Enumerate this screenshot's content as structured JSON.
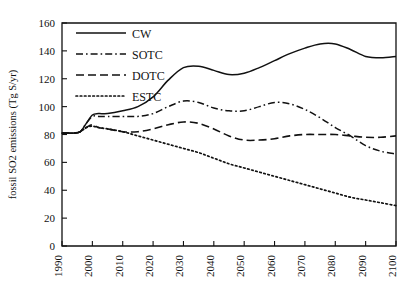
{
  "chart_data": {
    "type": "line",
    "title": "",
    "subtitle": "",
    "xlabel": "",
    "ylabel": "fossil SO2 emissions (Tg S/yr)",
    "xlim": [
      1990,
      2100
    ],
    "ylim": [
      0,
      160
    ],
    "grid": false,
    "legend_position": "top-left",
    "x_ticks": [
      "1990",
      "2000",
      "2010",
      "2020",
      "2030",
      "2040",
      "2050",
      "2060",
      "2070",
      "2080",
      "2090",
      "2100"
    ],
    "x_tick_values": [
      1990,
      2000,
      2010,
      2020,
      2030,
      2040,
      2050,
      2060,
      2070,
      2080,
      2090,
      2100
    ],
    "y_ticks": [
      "0",
      "20",
      "40",
      "60",
      "80",
      "100",
      "120",
      "140",
      "160"
    ],
    "y_tick_values": [
      0,
      20,
      40,
      60,
      80,
      100,
      120,
      140,
      160
    ],
    "x": [
      1990,
      1992,
      1994,
      1996,
      1998,
      2000,
      2002,
      2005,
      2010,
      2015,
      2020,
      2025,
      2030,
      2035,
      2040,
      2045,
      2050,
      2055,
      2060,
      2065,
      2070,
      2075,
      2080,
      2085,
      2090,
      2095,
      2100
    ],
    "series": [
      {
        "name": "CW",
        "style": "solid",
        "color": "#111111",
        "values": [
          81,
          81,
          81,
          82,
          88,
          94,
          95,
          95,
          97,
          100,
          107,
          119,
          128,
          129,
          126,
          123,
          124,
          128,
          133,
          138,
          142,
          145,
          145,
          141,
          136,
          135,
          136
        ]
      },
      {
        "name": "SOTC",
        "style": "dash-dot",
        "color": "#111111",
        "values": [
          81,
          81,
          81,
          82,
          88,
          93,
          93,
          93,
          93,
          93,
          95,
          100,
          104,
          103,
          99,
          97,
          97,
          100,
          103,
          102,
          98,
          92,
          85,
          79,
          72,
          68,
          66
        ]
      },
      {
        "name": "DOTC",
        "style": "dashed",
        "color": "#111111",
        "values": [
          81,
          81,
          81,
          82,
          85,
          87,
          85,
          84,
          82,
          82,
          84,
          87,
          89,
          88,
          84,
          79,
          76,
          76,
          77,
          79,
          80,
          80,
          80,
          79,
          78,
          78,
          79
        ]
      },
      {
        "name": "ESTC",
        "style": "dotted",
        "color": "#111111",
        "values": [
          81,
          81,
          81,
          82,
          85,
          86,
          85,
          84,
          82,
          79,
          76,
          73,
          70,
          67,
          63,
          59,
          56,
          53,
          50,
          47,
          44,
          41,
          38,
          35,
          33,
          31,
          29
        ]
      }
    ]
  },
  "legend": {
    "entries": [
      {
        "label": "CW"
      },
      {
        "label": "SOTC"
      },
      {
        "label": "DOTC"
      },
      {
        "label": "ESTC"
      }
    ]
  },
  "axes": {
    "y_axis_title": "fossil SO2 emissions (Tg S/yr)"
  }
}
